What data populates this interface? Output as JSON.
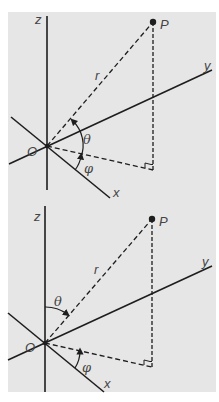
{
  "figure": {
    "background": "#e6e6e6",
    "line_color": "#1e1e1e",
    "label_color": "#444444",
    "panels": [
      {
        "id": "top",
        "labels": {
          "z": "z",
          "y": "y",
          "x": "x",
          "origin": "O",
          "point": "P",
          "radius": "r",
          "theta": "θ",
          "phi": "φ"
        }
      },
      {
        "id": "bottom",
        "labels": {
          "z": "z",
          "y": "y",
          "x": "x",
          "origin": "O",
          "point": "P",
          "radius": "r",
          "theta": "θ",
          "phi": "φ"
        }
      }
    ]
  }
}
